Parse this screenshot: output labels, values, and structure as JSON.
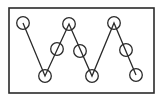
{
  "diagram": {
    "type": "zigzag-line-with-circles",
    "colors": {
      "background": "#ffffff",
      "stroke": "#2a2a2a"
    },
    "frame": {
      "x": 9,
      "y": 8,
      "width": 145,
      "height": 85
    },
    "polyline": [
      [
        23,
        23
      ],
      [
        45,
        76
      ],
      [
        69,
        24
      ],
      [
        92,
        76
      ],
      [
        114,
        23
      ],
      [
        136,
        75
      ]
    ],
    "circle_radius": 6.3,
    "circles": [
      {
        "id": "node-1",
        "cx": 23,
        "cy": 23
      },
      {
        "id": "node-2",
        "cx": 45,
        "cy": 76
      },
      {
        "id": "node-3",
        "cx": 57,
        "cy": 49
      },
      {
        "id": "node-4",
        "cx": 69,
        "cy": 24
      },
      {
        "id": "node-5",
        "cx": 80,
        "cy": 51
      },
      {
        "id": "node-6",
        "cx": 92,
        "cy": 76
      },
      {
        "id": "node-7",
        "cx": 114,
        "cy": 23
      },
      {
        "id": "node-8",
        "cx": 126,
        "cy": 50
      },
      {
        "id": "node-9",
        "cx": 136,
        "cy": 75
      }
    ]
  }
}
